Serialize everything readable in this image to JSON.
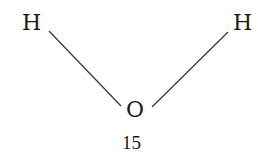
{
  "diagram": {
    "type": "molecule-structure",
    "atoms": [
      {
        "id": "h-left",
        "symbol": "H"
      },
      {
        "id": "h-right",
        "symbol": "H"
      },
      {
        "id": "o-center",
        "symbol": "O"
      }
    ],
    "bonds": [
      {
        "from": "h-left",
        "to": "o-center"
      },
      {
        "from": "o-center",
        "to": "h-right"
      }
    ],
    "caption": "15",
    "colors": {
      "ink": "#1a1a1a",
      "bond": "#333333",
      "background": "#ffffff"
    }
  }
}
